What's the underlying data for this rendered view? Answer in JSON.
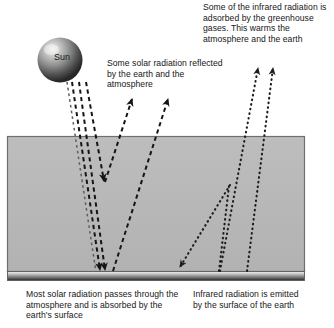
{
  "diagram": {
    "sun": {
      "label": "Sun"
    },
    "captions": {
      "absorbed_by_greenhouse_gases": "Some of the infrared radiation is adsorbed by the greenhouse gases. This warms the atmosphere and the earth",
      "reflected_solar": "Some solar radiation reflected by the earth and the atmosphere",
      "most_solar_absorbed": "Most solar radiation passes through the atmosphere and is absorbed by the earth's surface",
      "infrared_emitted": "Infrared radiation is emitted by the surface of the earth"
    },
    "regions": {
      "atmosphere_label": "atmosphere",
      "earth_surface_label": "earth surface"
    },
    "colors": {
      "background": "#ffffff",
      "atmosphere_fill": "#b8b8b8",
      "atmosphere_border": "#6f6f6f",
      "surface_light": "#f2f2f2",
      "surface_dark": "#2b2b2b",
      "solar_ray": "#151515",
      "infrared_ray": "#1d1d1d",
      "sun_highlight": "#ededed",
      "sun_mid": "#8a8a8a",
      "sun_dark": "#2e2e2e",
      "text": "#161616"
    },
    "rays": {
      "solar_incoming_label": "solar radiation incoming",
      "solar_reflected_label": "solar radiation reflected",
      "infrared_outgoing_label": "infrared radiation outgoing",
      "infrared_back_label": "infrared radiation back to surface"
    }
  }
}
